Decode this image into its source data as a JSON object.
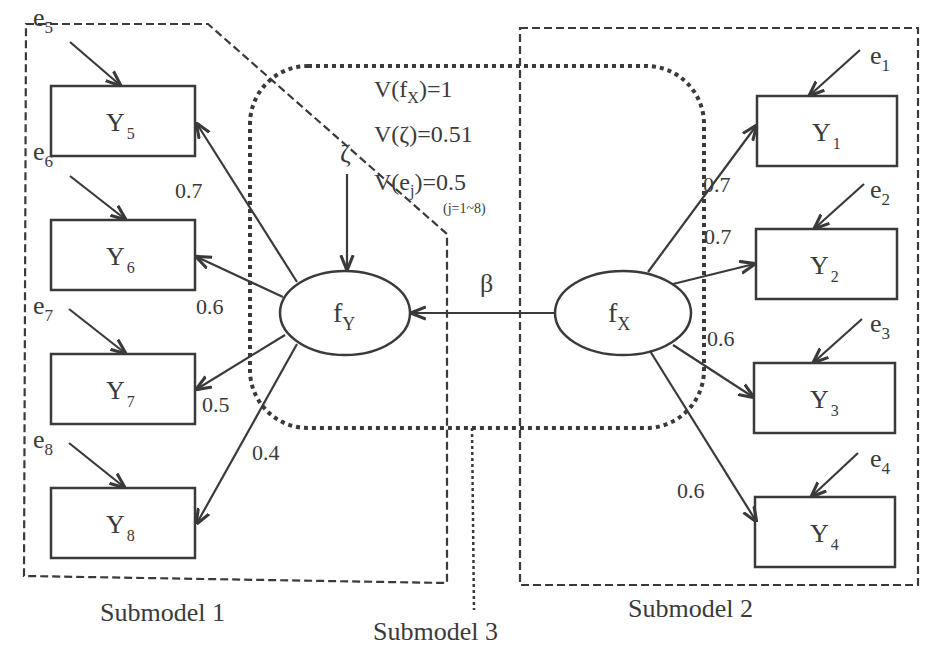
{
  "diagram": {
    "type": "structural-equation-model",
    "submodels": [
      {
        "id": "submodel1",
        "label": "Submodel 1"
      },
      {
        "id": "submodel2",
        "label": "Submodel 2"
      },
      {
        "id": "submodel3",
        "label": "Submodel 3"
      }
    ],
    "latent": {
      "fY": {
        "main": "f",
        "sub": "Y"
      },
      "fX": {
        "main": "f",
        "sub": "X"
      }
    },
    "observed": [
      {
        "id": "Y1",
        "main": "Y",
        "sub": "1",
        "error": {
          "main": "e",
          "sub": "1"
        },
        "loading": "0.7"
      },
      {
        "id": "Y2",
        "main": "Y",
        "sub": "2",
        "error": {
          "main": "e",
          "sub": "2"
        },
        "loading": "0.7"
      },
      {
        "id": "Y3",
        "main": "Y",
        "sub": "3",
        "error": {
          "main": "e",
          "sub": "3"
        },
        "loading": "0.6"
      },
      {
        "id": "Y4",
        "main": "Y",
        "sub": "4",
        "error": {
          "main": "e",
          "sub": "4"
        },
        "loading": "0.6"
      },
      {
        "id": "Y5",
        "main": "Y",
        "sub": "5",
        "error": {
          "main": "e",
          "sub": "5"
        },
        "loading": "0.7"
      },
      {
        "id": "Y6",
        "main": "Y",
        "sub": "6",
        "error": {
          "main": "e",
          "sub": "6"
        },
        "loading": "0.6"
      },
      {
        "id": "Y7",
        "main": "Y",
        "sub": "7",
        "error": {
          "main": "e",
          "sub": "7"
        },
        "loading": "0.5"
      },
      {
        "id": "Y8",
        "main": "Y",
        "sub": "8",
        "error": {
          "main": "e",
          "sub": "8"
        },
        "loading": "0.4"
      }
    ],
    "path": {
      "label": "β",
      "from": "fX",
      "to": "fY"
    },
    "disturbance": {
      "label": "ζ"
    },
    "variances": {
      "fx": {
        "prefix": "V(f",
        "sub": "X",
        "suffix": ")=1"
      },
      "zeta": {
        "text": "V(ζ)=0.51"
      },
      "e": {
        "prefix": "V(e",
        "sub": "j",
        "suffix": ")=0.5",
        "note": "(j=1~8)"
      }
    }
  }
}
